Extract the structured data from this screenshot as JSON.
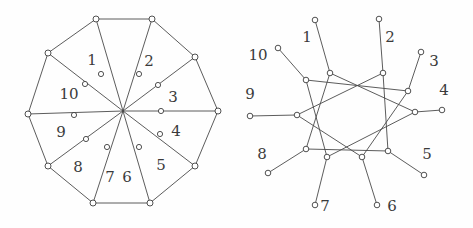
{
  "figure": {
    "title": "",
    "background_color": "#fefefe",
    "line_color": "#4a4a4a",
    "node_fill": "#ffffff",
    "node_stroke": "#3d3d3d",
    "label_color": "#3a3a3a"
  },
  "left_diagram": {
    "name": "wheel-decagon",
    "description": "Regular decagon with all ten vertices joined to a common centre; each spoke carries an intermediate node.",
    "center": {
      "x": 123,
      "y": 111
    },
    "outer_radius": 95,
    "inner_node_radius": 38,
    "rotation_deg": -90,
    "vertex_count": 10,
    "outer_vertices": [
      {
        "label": "1",
        "x": 96,
        "y": 19
      },
      {
        "label": "2",
        "x": 152,
        "y": 19
      },
      {
        "label": "3",
        "x": 195,
        "y": 57
      },
      {
        "label": "4",
        "x": 218,
        "y": 111
      },
      {
        "label": "5",
        "x": 195,
        "y": 166
      },
      {
        "label": "6",
        "x": 150,
        "y": 203
      },
      {
        "label": "7",
        "x": 93,
        "y": 203
      },
      {
        "label": "8",
        "x": 48,
        "y": 166
      },
      {
        "label": "9",
        "x": 28,
        "y": 114
      },
      {
        "label": "10",
        "x": 48,
        "y": 53
      }
    ],
    "spoke_nodes": [
      {
        "label": "1",
        "x": 101,
        "y": 74
      },
      {
        "label": "2",
        "x": 139,
        "y": 74
      },
      {
        "label": "3",
        "x": 158,
        "y": 85
      },
      {
        "label": "4",
        "x": 161,
        "y": 111
      },
      {
        "label": "5",
        "x": 160,
        "y": 134
      },
      {
        "label": "6",
        "x": 139,
        "y": 147
      },
      {
        "label": "7",
        "x": 107,
        "y": 147
      },
      {
        "label": "8",
        "x": 86,
        "y": 139
      },
      {
        "label": "9",
        "x": 74,
        "y": 115
      },
      {
        "label": "10",
        "x": 85,
        "y": 84
      }
    ],
    "labels": [
      {
        "text": "1",
        "x": 92,
        "y": 61
      },
      {
        "text": "2",
        "x": 149,
        "y": 62
      },
      {
        "text": "3",
        "x": 173,
        "y": 98
      },
      {
        "text": "4",
        "x": 176,
        "y": 132
      },
      {
        "text": "5",
        "x": 161,
        "y": 166
      },
      {
        "text": "6",
        "x": 127,
        "y": 178
      },
      {
        "text": "7",
        "x": 110,
        "y": 178
      },
      {
        "text": "8",
        "x": 78,
        "y": 168
      },
      {
        "text": "9",
        "x": 61,
        "y": 133
      },
      {
        "text": "10",
        "x": 69,
        "y": 95
      }
    ]
  },
  "right_diagram": {
    "name": "star-polygon-10-3",
    "description": "Ten inner vertices joined in a {10/3} star polygon; each inner vertex carries one pendant leaf node radiating outward.",
    "center": {
      "x": 357,
      "y": 114
    },
    "inner_radius": 58,
    "leaf_radius": 100,
    "rotation_deg": -90,
    "vertex_count": 10,
    "star_step": 3,
    "inner_vertices": [
      {
        "label": "1",
        "x": 330,
        "y": 73
      },
      {
        "label": "2",
        "x": 383,
        "y": 73
      },
      {
        "label": "3",
        "x": 408,
        "y": 91
      },
      {
        "label": "4",
        "x": 415,
        "y": 112
      },
      {
        "label": "5",
        "x": 388,
        "y": 151
      },
      {
        "label": "6",
        "x": 362,
        "y": 157
      },
      {
        "label": "7",
        "x": 327,
        "y": 157
      },
      {
        "label": "8",
        "x": 306,
        "y": 149
      },
      {
        "label": "9",
        "x": 297,
        "y": 115
      },
      {
        "label": "10",
        "x": 306,
        "y": 80
      }
    ],
    "leaf_vertices": [
      {
        "label": "1",
        "x": 315,
        "y": 20
      },
      {
        "label": "2",
        "x": 379,
        "y": 19
      },
      {
        "label": "3",
        "x": 421,
        "y": 52
      },
      {
        "label": "4",
        "x": 442,
        "y": 110
      },
      {
        "label": "5",
        "x": 424,
        "y": 175
      },
      {
        "label": "6",
        "x": 377,
        "y": 205
      },
      {
        "label": "7",
        "x": 315,
        "y": 205
      },
      {
        "label": "8",
        "x": 268,
        "y": 173
      },
      {
        "label": "9",
        "x": 250,
        "y": 116
      },
      {
        "label": "10",
        "x": 278,
        "y": 48
      }
    ],
    "labels": [
      {
        "text": "1",
        "x": 307,
        "y": 38
      },
      {
        "text": "2",
        "x": 390,
        "y": 38
      },
      {
        "text": "3",
        "x": 434,
        "y": 62
      },
      {
        "text": "4",
        "x": 444,
        "y": 91
      },
      {
        "text": "5",
        "x": 427,
        "y": 155
      },
      {
        "text": "6",
        "x": 392,
        "y": 207
      },
      {
        "text": "7",
        "x": 325,
        "y": 207
      },
      {
        "text": "8",
        "x": 262,
        "y": 155
      },
      {
        "text": "9",
        "x": 250,
        "y": 95
      },
      {
        "text": "10",
        "x": 258,
        "y": 56
      }
    ]
  }
}
